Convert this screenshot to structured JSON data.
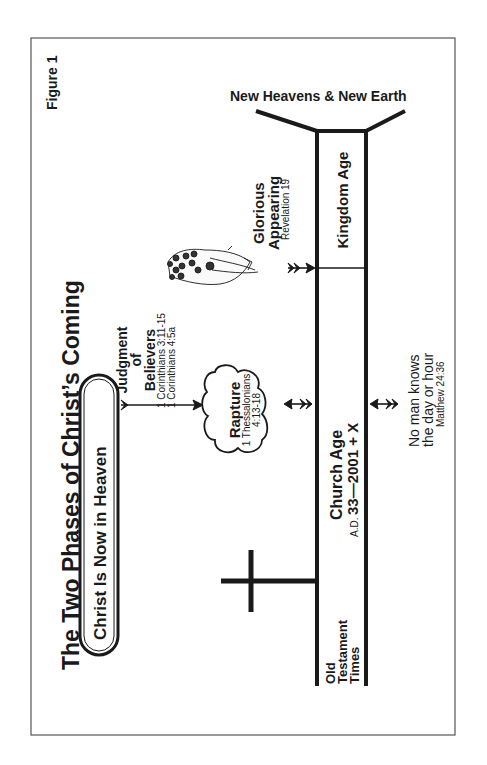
{
  "figure": {
    "label": "Figure 1",
    "title": "The Two Phases of Christ’s Coming"
  },
  "pill": {
    "text": "Christ Is Now in Heaven"
  },
  "judgment": {
    "line1": "Judgment",
    "line2": "of",
    "line3": "Believers",
    "ref1": "1 Corinthians 3:11-15",
    "ref2": "1 Corinthians 4:5a"
  },
  "rapture": {
    "title": "Rapture",
    "ref1": "1 Thessalonians",
    "ref2": "4:13-18"
  },
  "glorious": {
    "line1": "Glorious",
    "line2": "Appearing",
    "ref": "Revelation 19"
  },
  "timeline": {
    "new_heavens": "New Heavens & New Earth",
    "kingdom_age": "Kingdom Age",
    "church_age": "Church Age",
    "church_dates_prefix": "A.D.",
    "church_dates": "33—2001 + X",
    "old_testament_1": "Old",
    "old_testament_2": "Testament",
    "old_testament_3": "Times"
  },
  "no_man": {
    "line1": "No man knows",
    "line2": "the day or hour",
    "ref": "Matthew 24:36"
  },
  "colors": {
    "ink": "#1a1a1a",
    "frame": "#555555",
    "background": "#ffffff"
  }
}
